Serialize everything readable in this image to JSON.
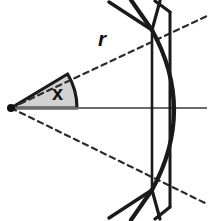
{
  "figure": {
    "background_color": "#ffffff",
    "width": 209,
    "height": 221,
    "labels": {
      "radius_label": "r",
      "angle_label": "x"
    },
    "colors": {
      "stroke_dark": "#1a1a1a",
      "wedge_fill": "#d2d2d2",
      "wedge_edge": "#1a1a1a",
      "dashed_stroke": "#2b2b2b",
      "axis_stroke": "#6b6b6b"
    },
    "geometry": {
      "focus_point": {
        "x": 11,
        "y": 108,
        "radius": 4
      },
      "axis_line": {
        "x1": 11,
        "y1": 108,
        "x2": 207,
        "y2": 108
      },
      "wedge": {
        "vertex": {
          "x": 11,
          "y": 108
        },
        "radius": 66,
        "start_angle_deg": 0,
        "end_angle_deg": -31
      },
      "dashed_upper_ray": {
        "x1": 11,
        "y1": 108,
        "x2": 207,
        "y2": 16
      },
      "dashed_lower_ray": {
        "x1": 11,
        "y1": 108,
        "x2": 207,
        "y2": 204
      },
      "arc": {
        "top": {
          "x": 152,
          "y": 30
        },
        "control": {
          "x": 196,
          "y": 110
        },
        "bottom": {
          "x": 152,
          "y": 190
        }
      },
      "vertical_inner": {
        "x": 152,
        "y1": 30,
        "y2": 190
      },
      "vertical_outer": {
        "x": 170,
        "y1": 12,
        "y2": 207
      },
      "spurs_top": [
        {
          "x1": 152,
          "y1": 30,
          "x2": 109,
          "y2": 2
        },
        {
          "x1": 152,
          "y1": 30,
          "x2": 131,
          "y2": 0
        },
        {
          "x1": 152,
          "y1": 30,
          "x2": 160,
          "y2": 1
        },
        {
          "x1": 170,
          "y1": 12,
          "x2": 155,
          "y2": 1
        }
      ],
      "spurs_bottom": [
        {
          "x1": 152,
          "y1": 190,
          "x2": 109,
          "y2": 218
        },
        {
          "x1": 152,
          "y1": 190,
          "x2": 131,
          "y2": 220
        },
        {
          "x1": 152,
          "y1": 190,
          "x2": 160,
          "y2": 219
        },
        {
          "x1": 170,
          "y1": 207,
          "x2": 155,
          "y2": 219
        }
      ]
    }
  }
}
